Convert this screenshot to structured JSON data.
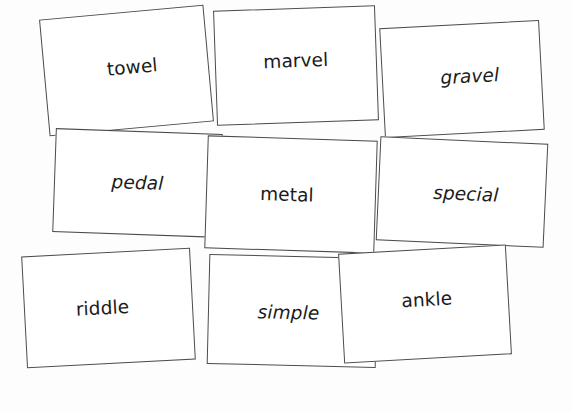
{
  "board": {
    "name": "word-card-board",
    "background_color": "#fdfdfd",
    "card_fill_color": "#ffffff",
    "card_border_color": "#4b4b4f",
    "text_color": "#1b1b1b",
    "card_count": 9
  },
  "cards": [
    {
      "id": "towel",
      "label": "towel",
      "style": "regular",
      "row": 1,
      "column": 1
    },
    {
      "id": "marvel",
      "label": "marvel",
      "style": "regular",
      "row": 1,
      "column": 2
    },
    {
      "id": "gravel",
      "label": "gravel",
      "style": "italic",
      "row": 1,
      "column": 3
    },
    {
      "id": "pedal",
      "label": "pedal",
      "style": "italic",
      "row": 2,
      "column": 1
    },
    {
      "id": "metal",
      "label": "metal",
      "style": "regular",
      "row": 2,
      "column": 2
    },
    {
      "id": "special",
      "label": "special",
      "style": "italic",
      "row": 2,
      "column": 3
    },
    {
      "id": "riddle",
      "label": "riddle",
      "style": "regular",
      "row": 3,
      "column": 1
    },
    {
      "id": "simple",
      "label": "simple",
      "style": "italic",
      "row": 3,
      "column": 2
    },
    {
      "id": "ankle",
      "label": "ankle",
      "style": "regular",
      "row": 3,
      "column": 3
    }
  ]
}
